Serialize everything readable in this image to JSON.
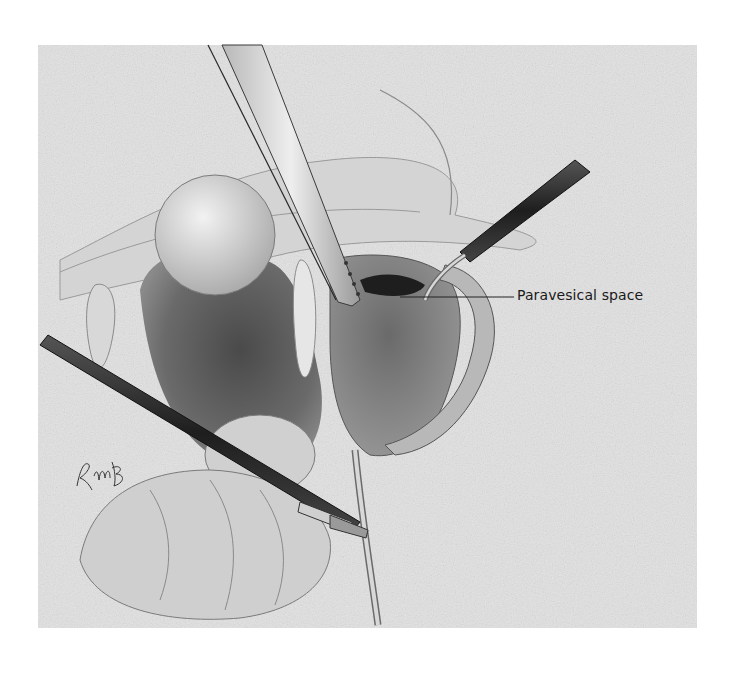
{
  "figure": {
    "type": "surgical-illustration",
    "style": "grayscale stippled pencil drawing",
    "colors": {
      "background": "#ffffff",
      "panel": "#e4e4e4",
      "tissue_light": "#d8d8d8",
      "tissue_mid": "#9a9a9a",
      "tissue_dark": "#5a5a5a",
      "cavity": "#3a3a3a",
      "instrument": "#2a2a2a",
      "line": "#1a1a1a"
    },
    "labels": [
      {
        "id": "paravesical-space",
        "text": "Paravesical space"
      }
    ],
    "signature": "RMB"
  }
}
